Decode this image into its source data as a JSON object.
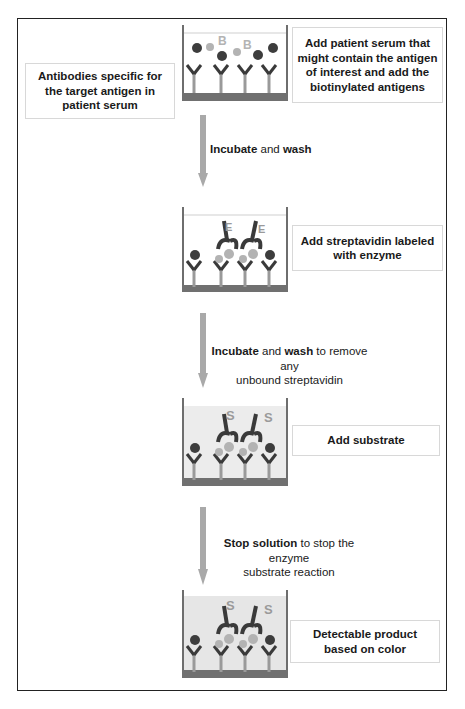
{
  "diagram": {
    "type": "competitive ELISA workflow",
    "left_label": "Antibodies specific for the target antigen in patient serum",
    "steps": [
      {
        "id": 1,
        "description": "Add patient serum that might contain the antigen of interest and add the biotinylated antigens",
        "well_state": "antibodies-with-free-and-biotinylated-antigens"
      },
      {
        "id": 2,
        "description": "Add streptavidin labeled with enzyme",
        "well_state": "streptavidin-enzyme-bound"
      },
      {
        "id": 3,
        "description": "Add substrate",
        "well_state": "substrate-added"
      },
      {
        "id": 4,
        "description": "Detectable product based on color",
        "well_state": "color-developed"
      }
    ],
    "transitions": [
      {
        "bold1": "Incubate",
        "mid": " and ",
        "bold2": "wash",
        "rest": "",
        "line2": ""
      },
      {
        "bold1": "Incubate",
        "mid": " and ",
        "bold2": "wash",
        "rest": " to remove any",
        "line2": "unbound streptavidin"
      },
      {
        "bold1": "Stop solution",
        "mid": " to stop the enzyme",
        "bold2": "",
        "rest": "",
        "line2": "substrate reaction"
      }
    ],
    "well_labels": {
      "biotin": "B",
      "enzyme": "E",
      "substrate": "S"
    },
    "colors": {
      "frame": "#222222",
      "box_border": "#d8d8d8",
      "arrow": "#a9a9a9",
      "well_wall": "#6e6e6e",
      "well_base": "#707070",
      "antibody_stem": "#9a9a9a",
      "antibody_arm": "#3a3a3a",
      "antigen_dark": "#3d3d3d",
      "antigen_biotin": "#b3b3b3",
      "streptavidin": "#3a3a3a",
      "liquid_substrate": "#ececec",
      "text": "#1a1a1a"
    }
  }
}
